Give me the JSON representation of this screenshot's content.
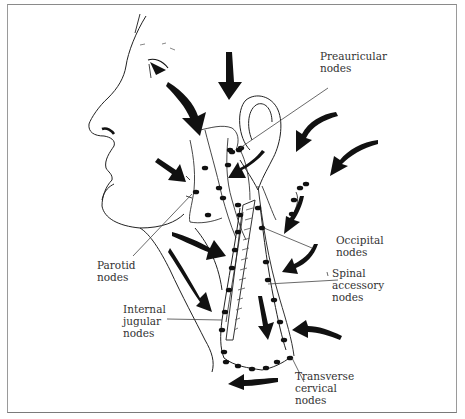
{
  "figure": {
    "labels": [
      {
        "id": "preauricular",
        "text": "Preauricular\nnodes"
      },
      {
        "id": "occipital",
        "text": "Occipital\nnodes"
      },
      {
        "id": "spinal_accessory",
        "text": "Spinal\naccessory\nnodes"
      },
      {
        "id": "parotid",
        "text": "Parotid\nnodes"
      },
      {
        "id": "internal_jugular",
        "text": "Internal\njugular\nnodes"
      },
      {
        "id": "transverse_cervical",
        "text": "Transverse\ncervical\nnodes"
      }
    ],
    "colors": {
      "ink": "#111111",
      "label_text": "#333333",
      "frame": "#8a8a8a",
      "background": "#ffffff"
    }
  }
}
